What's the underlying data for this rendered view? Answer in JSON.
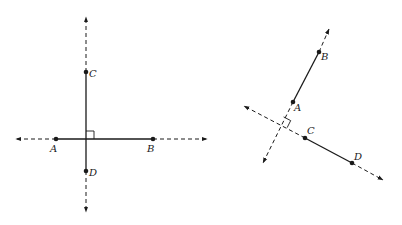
{
  "diagram": {
    "left_figure": {
      "description": "Two perpendicular lines: segment AB on horizontal line, segment CD on vertical line, meeting at right angle",
      "points": {
        "A": {
          "label": "A",
          "x": 56,
          "y": 139
        },
        "B": {
          "label": "B",
          "x": 153,
          "y": 139
        },
        "C": {
          "label": "C",
          "x": 86,
          "y": 72
        },
        "D": {
          "label": "D",
          "x": 86,
          "y": 171
        }
      },
      "horizontal_line": {
        "x1": 16,
        "x2": 207,
        "y": 139
      },
      "vertical_line": {
        "x": 86,
        "y1": 17,
        "y2": 212
      },
      "right_angle_at": {
        "x": 86,
        "y": 139
      }
    },
    "right_figure": {
      "description": "Two perpendicular lines: segment AB on one line, segment CD on perpendicular line; segments do not intersect but their lines meet at right angle",
      "points": {
        "A": {
          "label": "A",
          "x": 293,
          "y": 102
        },
        "B": {
          "label": "B",
          "x": 319,
          "y": 52
        },
        "C": {
          "label": "C",
          "x": 305,
          "y": 138
        },
        "D": {
          "label": "D",
          "x": 352,
          "y": 163
        }
      },
      "line_AB": {
        "x1": 329,
        "y1": 29,
        "x2": 263,
        "y2": 163
      },
      "line_CD": {
        "x1": 244,
        "y1": 106,
        "x2": 383,
        "y2": 180
      },
      "right_angle_at": {
        "x": 280,
        "y": 124
      }
    },
    "labels": {
      "left_A": "A",
      "left_B": "B",
      "left_C": "C",
      "left_D": "D",
      "right_A": "A",
      "right_B": "B",
      "right_C": "C",
      "right_D": "D"
    },
    "colors": {
      "stroke": "#1a1a1a",
      "background": "#ffffff"
    }
  }
}
